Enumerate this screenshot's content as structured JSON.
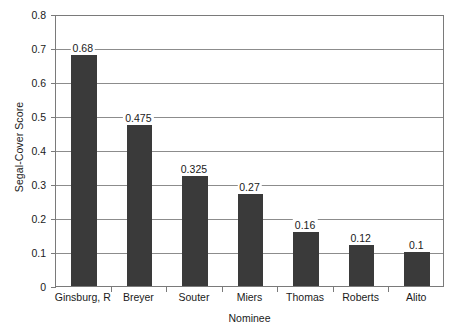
{
  "chart_data": {
    "type": "bar",
    "title": "",
    "subtitle": "",
    "xlabel": "Nominee",
    "ylabel": "Segal-Cover Score",
    "categories": [
      "Ginsburg, R",
      "Breyer",
      "Souter",
      "Miers",
      "Thomas",
      "Roberts",
      "Alito"
    ],
    "values": [
      0.68,
      0.475,
      0.325,
      0.27,
      0.16,
      0.12,
      0.1
    ],
    "value_labels": [
      "0.68",
      "0.475",
      "0.325",
      "0.27",
      "0.16",
      "0.12",
      "0.1"
    ],
    "ylim": [
      0,
      0.8
    ],
    "ytick_values": [
      0,
      0.1,
      0.2,
      0.3,
      0.4,
      0.5,
      0.6,
      0.7,
      0.8
    ],
    "ytick_labels": [
      "0",
      "0.1",
      "0.2",
      "0.3",
      "0.4",
      "0.5",
      "0.6",
      "0.7",
      "0.8"
    ],
    "grid": "horizontal",
    "legend": "none",
    "bar_color": "#3a3a3a",
    "axis_color": "#7a7a7a",
    "gridline_color": "#8c8c8c",
    "background_color": "#ffffff"
  }
}
